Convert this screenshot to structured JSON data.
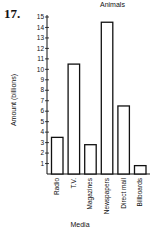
{
  "problem_number": "17.",
  "chart_data": {
    "type": "bar",
    "title": "Animals",
    "xlabel": "Media",
    "ylabel": "Amount (billions)",
    "categories": [
      "Radio",
      "T.V.",
      "Magazines",
      "Newspapers",
      "Direct mail",
      "Billboards"
    ],
    "values": [
      3.5,
      10.5,
      2.8,
      14.5,
      6.5,
      0.8
    ],
    "ylim": [
      0,
      15
    ],
    "yticks": [
      1,
      2,
      3,
      4,
      5,
      6,
      7,
      8,
      9,
      10,
      11,
      12,
      13,
      14,
      15
    ],
    "grid": false,
    "legend": "none",
    "bar_fill": "#ffffff",
    "bar_stroke": "#111111"
  }
}
